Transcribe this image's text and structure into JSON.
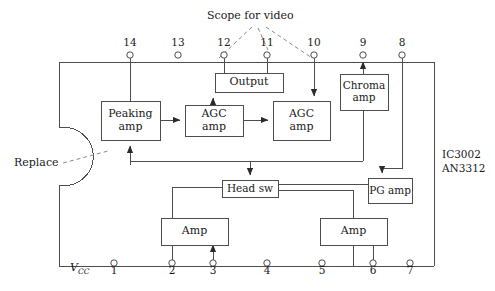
{
  "diagram": {
    "title_note": "Scope for video",
    "replace_note": "Replace",
    "ic_labels": [
      "IC3002",
      "AN3312"
    ],
    "vcc_label": "V",
    "vcc_sub": "CC",
    "blocks": [
      {
        "id": "peaking_amp",
        "lines": [
          "Peaking",
          "amp"
        ]
      },
      {
        "id": "agc_amp_1",
        "lines": [
          "AGC",
          "amp"
        ]
      },
      {
        "id": "agc_amp_2",
        "lines": [
          "AGC",
          "amp"
        ]
      },
      {
        "id": "output",
        "lines": [
          "Output"
        ]
      },
      {
        "id": "chroma_amp",
        "lines": [
          "Chroma",
          "amp"
        ]
      },
      {
        "id": "head_sw",
        "lines": [
          "Head sw"
        ]
      },
      {
        "id": "pg_amp",
        "lines": [
          "PG amp"
        ]
      },
      {
        "id": "amp_left",
        "lines": [
          "Amp"
        ]
      },
      {
        "id": "amp_right",
        "lines": [
          "Amp"
        ]
      }
    ],
    "pins_top": [
      "14",
      "13",
      "12",
      "11",
      "10",
      "9",
      "8"
    ],
    "pins_bottom": [
      "1",
      "2",
      "3",
      "4",
      "5",
      "6",
      "7"
    ]
  },
  "colors": {
    "line": "#4d4d4d",
    "text": "#1a1a1a",
    "dashed": "#8a8a8a",
    "background": "#ffffff"
  }
}
